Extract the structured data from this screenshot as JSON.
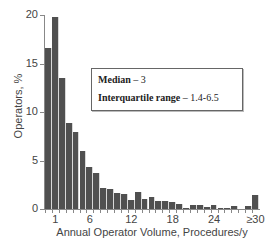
{
  "chart_data": {
    "type": "bar",
    "title": "",
    "xlabel": "Annual Operator Volume, Procedures/y",
    "ylabel": "Operators, %",
    "ylim": [
      0,
      20
    ],
    "yticks": [
      0,
      5,
      10,
      15,
      20
    ],
    "grid": false,
    "categories": [
      "0",
      "1",
      "2",
      "3",
      "4",
      "5",
      "6",
      "7",
      "8",
      "9",
      "10",
      "11",
      "12",
      "13",
      "14",
      "15",
      "16",
      "17",
      "18",
      "19",
      "20",
      "21",
      "22",
      "23",
      "24",
      "25",
      "26",
      "27",
      "28",
      "29",
      "≥30"
    ],
    "xtick_labels": [
      {
        "index": 1,
        "label": "1"
      },
      {
        "index": 6,
        "label": "6"
      },
      {
        "index": 12,
        "label": "12"
      },
      {
        "index": 18,
        "label": "18"
      },
      {
        "index": 24,
        "label": "24"
      },
      {
        "index": 30,
        "label": "≥30"
      }
    ],
    "values": [
      16.6,
      19.8,
      13.5,
      8.9,
      7.9,
      6.0,
      4.3,
      3.7,
      2.2,
      2.1,
      1.7,
      1.5,
      0.95,
      1.8,
      1.0,
      1.2,
      0.85,
      0.8,
      0.75,
      0.5,
      0.15,
      0.4,
      0.4,
      0.25,
      0.45,
      0.15,
      0.15,
      0.35,
      0.0,
      0.35,
      1.45
    ],
    "bar_color": "#505050",
    "legend": {
      "position": "upper right (inset box)",
      "entries": [
        {
          "label": "Median",
          "value": " – 3"
        },
        {
          "label": "Interquartile  range",
          "value": " – 1.4-6.5"
        }
      ]
    }
  },
  "labels": {
    "y_axis_title": "Operators, %",
    "x_axis_title": "Annual Operator Volume, Procedures/y",
    "median_label": "Median",
    "median_value": " – 3",
    "iqr_label": "Interquartile  range",
    "iqr_value": " – 1.4-6.5"
  }
}
